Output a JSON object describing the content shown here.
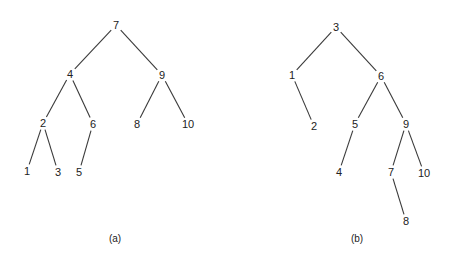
{
  "diagram": {
    "type": "binary-search-trees",
    "trees": [
      {
        "id": "a",
        "caption": "(a)",
        "caption_pos": [
          115,
          238
        ],
        "nodes": [
          {
            "label": "7",
            "x": 116,
            "y": 25
          },
          {
            "label": "4",
            "x": 70,
            "y": 74
          },
          {
            "label": "9",
            "x": 162,
            "y": 75
          },
          {
            "label": "2",
            "x": 43,
            "y": 123
          },
          {
            "label": "6",
            "x": 93,
            "y": 124
          },
          {
            "label": "8",
            "x": 137,
            "y": 124
          },
          {
            "label": "10",
            "x": 188,
            "y": 124
          },
          {
            "label": "1",
            "x": 27,
            "y": 171
          },
          {
            "label": "3",
            "x": 58,
            "y": 172
          },
          {
            "label": "5",
            "x": 79,
            "y": 172
          }
        ],
        "edges": [
          [
            "7",
            "4"
          ],
          [
            "7",
            "9"
          ],
          [
            "4",
            "2"
          ],
          [
            "4",
            "6"
          ],
          [
            "9",
            "8"
          ],
          [
            "9",
            "10"
          ],
          [
            "2",
            "1"
          ],
          [
            "2",
            "3"
          ],
          [
            "6",
            "5"
          ]
        ]
      },
      {
        "id": "b",
        "caption": "(b)",
        "caption_pos": [
          357,
          238
        ],
        "nodes": [
          {
            "label": "3",
            "x": 336,
            "y": 27
          },
          {
            "label": "1",
            "x": 292,
            "y": 75
          },
          {
            "label": "6",
            "x": 381,
            "y": 76
          },
          {
            "label": "2",
            "x": 314,
            "y": 126
          },
          {
            "label": "5",
            "x": 355,
            "y": 124
          },
          {
            "label": "9",
            "x": 406,
            "y": 124
          },
          {
            "label": "4",
            "x": 339,
            "y": 172
          },
          {
            "label": "7",
            "x": 391,
            "y": 172
          },
          {
            "label": "10",
            "x": 424,
            "y": 173
          },
          {
            "label": "8",
            "x": 406,
            "y": 221
          }
        ],
        "edges": [
          [
            "3",
            "1"
          ],
          [
            "3",
            "6"
          ],
          [
            "1",
            "2"
          ],
          [
            "6",
            "5"
          ],
          [
            "6",
            "9"
          ],
          [
            "5",
            "4"
          ],
          [
            "9",
            "7"
          ],
          [
            "9",
            "10"
          ],
          [
            "7",
            "8"
          ]
        ]
      }
    ]
  }
}
